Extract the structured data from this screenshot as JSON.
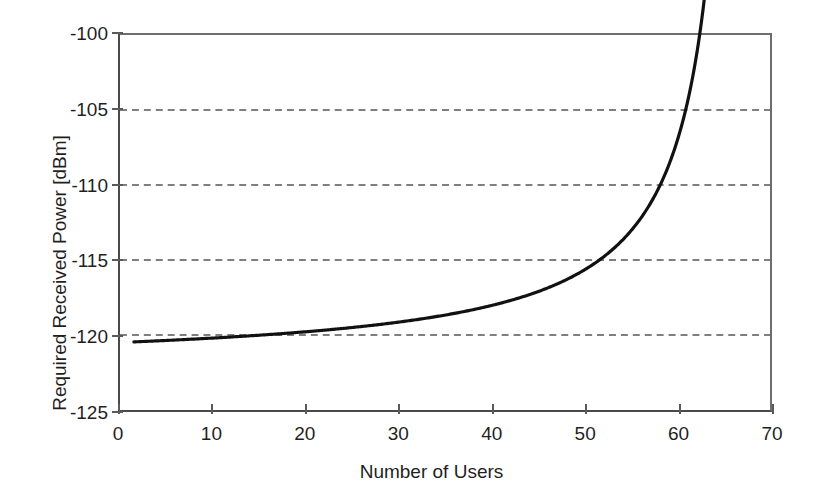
{
  "chart_data": {
    "type": "line",
    "title": "",
    "subtitle": "",
    "xlabel": "Number of Users",
    "ylabel": "Required Received Power [dBm]",
    "xlim": [
      0,
      70
    ],
    "ylim": [
      -125,
      -100
    ],
    "xticks": [
      0,
      10,
      20,
      30,
      40,
      50,
      60,
      70
    ],
    "xtick_labels": [
      "0",
      "10",
      "20",
      "30",
      "40",
      "50",
      "60",
      "70"
    ],
    "yticks": [
      -100,
      -105,
      -110,
      -115,
      -120,
      -125
    ],
    "ytick_labels": [
      "-100",
      "-105",
      "-110",
      "-115",
      "-120",
      "-125"
    ],
    "grid": {
      "horizontal": true,
      "vertical": false,
      "style": "dashed",
      "levels": [
        -105,
        -110,
        -115,
        -120
      ],
      "color": "#555555"
    },
    "legend": {
      "visible": false,
      "position": "none",
      "entries": []
    },
    "annotations": [],
    "series": [
      {
        "name": "Required Received Power",
        "color": "#111111",
        "line_width": 3.2,
        "markers": "none",
        "x": [
          1.5,
          3,
          5,
          7,
          9,
          11,
          13,
          15,
          17,
          19,
          21,
          23,
          25,
          27,
          29,
          31,
          33,
          35,
          37,
          39,
          41,
          43,
          45,
          47,
          49,
          51,
          53,
          55,
          57,
          59,
          60,
          61,
          62,
          63,
          64,
          65,
          65.5,
          66,
          66.3,
          66.5
        ],
        "values": [
          -120.5,
          -120.4,
          -120.3,
          -120.1,
          -119.9,
          -119.7,
          -119.5,
          -119.3,
          -119.1,
          -118.8,
          -118.5,
          -118.2,
          -117.9,
          -117.6,
          -117.3,
          -116.9,
          -116.5,
          -116.1,
          -115.7,
          -115.3,
          -114.8,
          -114.3,
          -113.7,
          -113.1,
          -115.0,
          -111.7,
          -111.0,
          -110.2,
          -109.3,
          -108.3,
          -107.7,
          -110.0,
          -106.3,
          -105.5,
          -104.6,
          -103.6,
          -103.1,
          -102.6,
          -102.4,
          -102.3
        ]
      }
    ],
    "curve_reference_points": [
      {
        "users": 1.5,
        "power_dbm": -120.5,
        "note": "start of curve"
      },
      {
        "users": 10,
        "power_dbm": -119.8
      },
      {
        "users": 20,
        "power_dbm": -118.6
      },
      {
        "users": 30,
        "power_dbm": -117.1
      },
      {
        "users": 40,
        "power_dbm": -115.1
      },
      {
        "users": 49,
        "power_dbm": -115.0,
        "note": "crosses -115 gridline"
      },
      {
        "users": 55,
        "power_dbm": -110.2
      },
      {
        "users": 61,
        "power_dbm": -110.0,
        "note": "crosses -110 gridline"
      },
      {
        "users": 66.5,
        "power_dbm": -102.3,
        "note": "end of curve, steep asymptote"
      }
    ]
  }
}
